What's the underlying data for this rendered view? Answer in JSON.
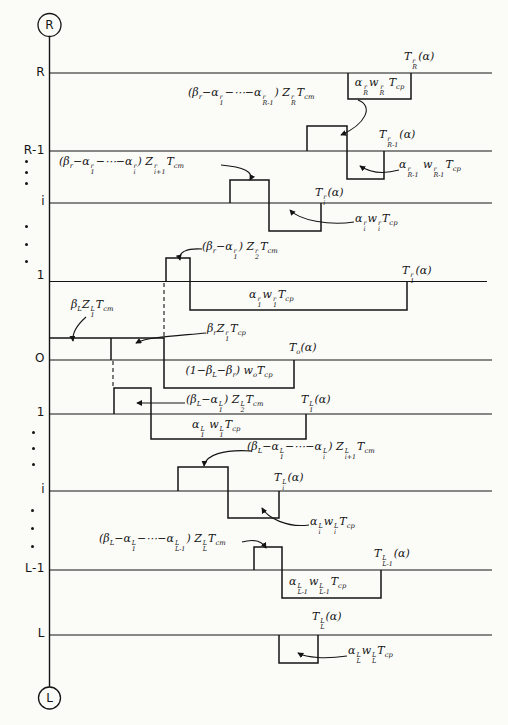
{
  "axis": {
    "top_terminal": "R",
    "bottom_terminal": "L",
    "rows": [
      "R",
      "R-1",
      "i",
      "1",
      "O",
      "1",
      "i",
      "L-1",
      "L"
    ]
  },
  "labels": {
    "t_R": "T{r|R}(α)",
    "w_R": "α{r|R}w{r|R} T_{cp}",
    "z_R": "(β_{r}−α{r|1}−⋯−α{r|R-1}) Z{r|R}T_{cm}",
    "t_R1": "T{r|R-1}(α)",
    "w_R1": "α{r|R-1} w{r|R-1}T_{cp}",
    "z_i1": "(β_{r}−α{r|1}−⋯−α{r|i}) Z{r|i+1}T_{cm}",
    "t_i": "T{r|i}(α)",
    "w_i": "α{r|i}w{r|i}T_{cp}",
    "z_2r": "(β_{r}−α{r|1}) Z{r|2}T_{cm}",
    "t_1r": "T{r|1}(α)",
    "w_1r": "α{r|1}w{r|1}T_{cp}",
    "bL": "β_{L}Z{L|1}T_{cm}",
    "br": "β_{r}Z{r|1}T_{cp}",
    "t_o": "T_{o}(α)",
    "w_o": "(1−β_{L}−β_{r}) w_{o}T_{cp}",
    "z_2L": "(β_{L}−α{L|1}) Z{L|2}T_{cm}",
    "t_1L": "T{L|1}(α)",
    "w_1L": "α{L|1} w{L|1}T_{cp}",
    "z_iL": "(β_{L}−α{L|1}−⋯−α{L|i}) Z{L|i+1}T_{cm}",
    "t_iL": "T{L|i}(α)",
    "w_iL": "α{L|i}w{L|i}T_{cp}",
    "z_L": "(β_{L}−α{L|1}−⋯−α{L|L-1}) Z{L|L}T_{cm}",
    "t_L1": "T{L|L-1}(α)",
    "w_L1": "α{L|L-1}w{L|L-1}T_{cp}",
    "t_LL": "T{L|L}(α)",
    "w_LL": "α{L|L}w{L|L}T_{cp}"
  }
}
